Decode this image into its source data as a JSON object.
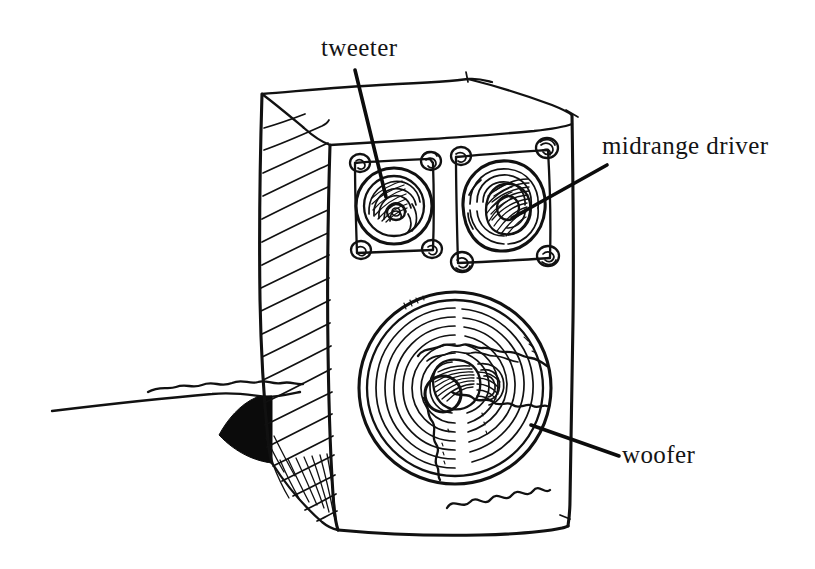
{
  "figure": {
    "style": "hand-drawn pen-and-ink line sketch",
    "background_color": "#ffffff",
    "ink_color": "#111111",
    "width": 815,
    "height": 569
  },
  "labels": {
    "tweeter": "tweeter",
    "midrange": "midrange driver",
    "woofer": "woofer"
  },
  "parts": {
    "cabinet": "speaker cabinet",
    "side_panel": "hatched left side panel",
    "top_panel": "top face",
    "front_baffle": "front baffle",
    "shadow": "cast shadow",
    "ground": "ground line"
  },
  "leaders": {
    "tweeter": "leader line from tweeter label to tweeter cone",
    "midrange": "leader line from midrange driver label to midrange cone",
    "woofer": "leader line from woofer label to woofer cone"
  }
}
